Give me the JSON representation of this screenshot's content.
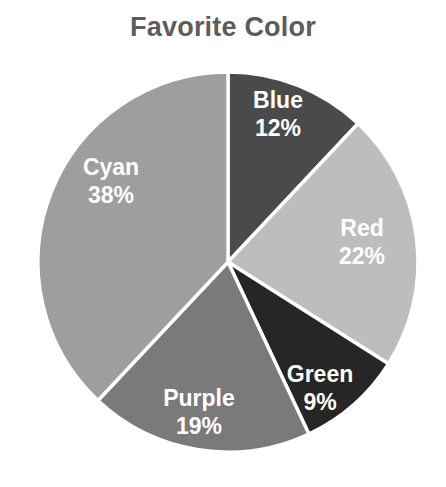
{
  "chart_data": {
    "type": "pie",
    "title": "Favorite Color",
    "xlabel": "",
    "ylabel": "",
    "legend": "none",
    "grid": false,
    "start_angle_deg": 90,
    "direction": "clockwise",
    "units": "percent",
    "categories": [
      "Blue",
      "Red",
      "Green",
      "Purple",
      "Cyan"
    ],
    "values": [
      12,
      22,
      9,
      19,
      38
    ],
    "labels": [
      "12%",
      "22%",
      "9%",
      "19%",
      "38%"
    ],
    "slices": [
      {
        "name": "Blue",
        "value": 12,
        "label": "12%",
        "color": "#4a4a4a",
        "label_color": "#ffffff",
        "label_x": 278,
        "label_y": 108
      },
      {
        "name": "Red",
        "value": 22,
        "label": "22%",
        "color": "#bdbdbd",
        "label_color": "#ffffff",
        "label_x": 362,
        "label_y": 236
      },
      {
        "name": "Green",
        "value": 9,
        "label": "9%",
        "color": "#262626",
        "label_color": "#ffffff",
        "label_x": 320,
        "label_y": 382
      },
      {
        "name": "Purple",
        "value": 19,
        "label": "19%",
        "color": "#7a7a7a",
        "label_color": "#ffffff",
        "label_x": 199,
        "label_y": 406
      },
      {
        "name": "Cyan",
        "value": 38,
        "label": "38%",
        "color": "#9e9e9e",
        "label_color": "#ffffff",
        "label_x": 111,
        "label_y": 175
      }
    ],
    "geometry": {
      "center_x": 228,
      "center_y": 262,
      "radius": 190,
      "separator_color": "#ffffff",
      "separator_width": 3.4
    },
    "title_color": "#5c5c5c",
    "background": "#ffffff"
  }
}
